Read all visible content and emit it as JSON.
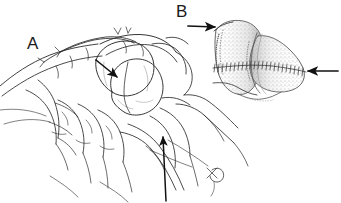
{
  "figure": {
    "type": "line-drawing-medical-illustration",
    "background_color": "#ffffff",
    "ink_color": "#1a1a1a",
    "width": 341,
    "height": 203
  },
  "panels": [
    {
      "id": "A",
      "label": "A",
      "label_x": 27,
      "label_y": 35,
      "description": "Gloved hands holding a bilobed anatomical specimen; a suture needle with thread trails from the lower right",
      "annotations": [
        {
          "name": "arrow-to-specimen-cleft",
          "direction": "down-right",
          "from_x": 96,
          "from_y": 60,
          "to_x": 118,
          "to_y": 78
        },
        {
          "name": "arrow-to-fingertip",
          "direction": "up",
          "from_x": 166,
          "from_y": 201,
          "to_x": 163,
          "to_y": 136
        }
      ]
    },
    {
      "id": "B",
      "label": "B",
      "label_x": 176,
      "label_y": 3,
      "description": "Stippled bilobed structure viewed end-on with a transverse suture line of hatch marks across its midline",
      "annotations": [
        {
          "name": "arrow-left-pointing-right",
          "direction": "right",
          "from_x": 188,
          "from_y": 26,
          "to_x": 216,
          "to_y": 26
        },
        {
          "name": "arrow-right-pointing-left",
          "direction": "left",
          "from_x": 337,
          "from_y": 71,
          "to_x": 307,
          "to_y": 71
        }
      ]
    }
  ]
}
